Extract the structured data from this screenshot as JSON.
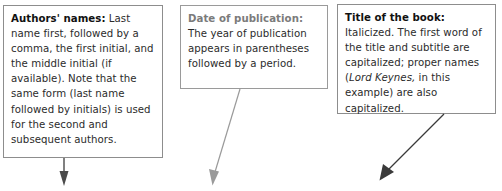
{
  "figure": {
    "type": "annotated-citation-callouts",
    "background_color": "#ffffff"
  },
  "callouts": [
    {
      "name": "authors-names",
      "lead": "Authors' names:",
      "lead_color": "#111111",
      "lead_style": "bold",
      "text": " Last name first, followed by a comma, the first initial, and the middle initial (if available). Note that the same form (last name followed by initials) is used for the second and subsequent authors.",
      "border_color": "#8d8d8d"
    },
    {
      "name": "date-of-publication",
      "lead": "Date of publication:",
      "lead_color": "#7b7b7b",
      "lead_style": "bold",
      "text": "The year of publication appears in parentheses followed by a period.",
      "border_color": "#9a9a9a"
    },
    {
      "name": "title-of-the-book",
      "lead": "Title of the book:",
      "lead_color": "#111111",
      "lead_style": "bold",
      "text_part_1": " Italicized. The first word of the title and subtitle are capitalized; proper names (",
      "text_italic": "Lord Keynes,",
      "text_part_2": " in this example) are also capitalized.",
      "border_color": "#8d8d8d"
    }
  ],
  "arrows": [
    {
      "name": "arrow-authors",
      "color": "#4a4a4a",
      "direction": "down",
      "from_x": 64,
      "from_y": 158,
      "to_x": 64,
      "to_y": 186
    },
    {
      "name": "arrow-date",
      "color": "#9a9a9a",
      "direction": "down-left",
      "from_x": 240,
      "from_y": 89,
      "to_x": 212,
      "to_y": 185
    },
    {
      "name": "arrow-title",
      "color": "#3a3a3a",
      "direction": "down-left",
      "from_x": 444,
      "from_y": 114,
      "to_x": 379,
      "to_y": 180
    }
  ]
}
